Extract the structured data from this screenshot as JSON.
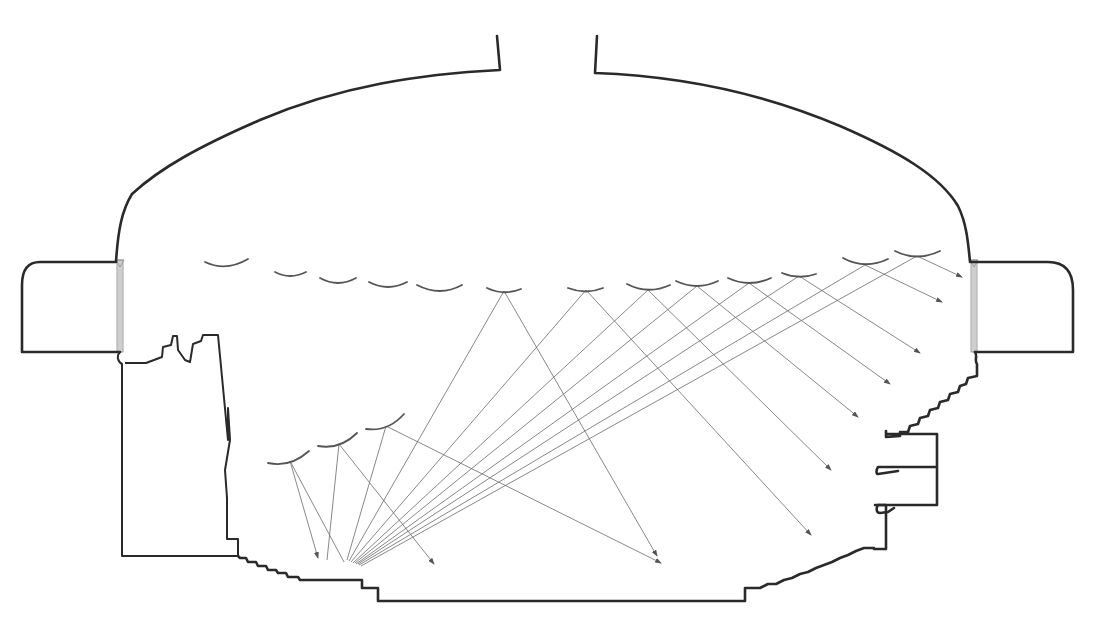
{
  "diagram": {
    "type": "architectural-acoustic-section",
    "canvas": {
      "width": 1093,
      "height": 621,
      "background": "#ffffff"
    },
    "colors": {
      "wall": "#2a2a2a",
      "reflector": "#555555",
      "ray": "#6a6a6a",
      "louver": "#e4e4e4"
    },
    "shell": {
      "roof_path": "M 497 36 L 500 70 C 420 74 340 86 260 120 C 200 146 160 168 132 194 C 122 210 118 230 116 262 L 40 262 Q 22 262 22 285 L 22 352 L 120 352",
      "roof_path_right": "M 597 36 L 595 73 C 680 76 760 92 840 126 C 900 152 940 176 958 206 C 966 222 968 240 970 262 L 1048 262 Q 1073 262 1073 290 L 1073 352 L 975 352"
    },
    "left_tower": {
      "path": "M 120 352 C 116 356 118 362 122 364 L 122 556 L 238 556 L 238 539 L 227 539 L 227 498 L 225 470 L 230 440 L 228 408 L 228 440 L 218 335 L 203 335 L 201 341 L 193 344 L 190 362 L 185 360 L 178 350 L 177 336 L 173 336 L 171 345 L 163 347 L 162 357 L 154 360 L 146 363 L 125 363"
    },
    "floor": {
      "path": "M 238 556 L 240 558 L 246 558 L 248 562 L 256 562 L 258 566 L 266 566 L 268 570 L 276 570 L 278 573 L 286 573 L 288 577 L 298 577 L 300 580 L 362 580 L 362 588 L 378 588 L 378 601 L 745 601 L 745 588 L 760 588 L 768 584 L 776 584 L 784 580 L 792 578 L 800 574 L 808 572 L 816 568 L 824 565 L 832 562 L 840 558 L 848 555 L 856 551 L 864 548 L 874 548 L 874 549 L 886 549 L 886 505 L 875 505"
    },
    "right_balconies": {
      "path": "M 975 352 C 978 356 974 360 977 364 L 977 376 L 968 378 L 966 384 L 960 386 L 958 392 L 950 394 L 948 400 L 940 402 L 938 408 L 930 410 L 928 416 L 920 418 L 918 424 L 910 426 L 908 432 L 900 432 L 900 436 L 886 437 L 886 431 L 886 434 L 937 434 L 937 467 L 878 467 C 876 470 876 474 878 474 L 898 471 M 937 467 L 937 505 L 878 505 C 876 508 876 513 880 513 L 888 512 L 894 508"
    },
    "windows": [
      {
        "name": "left-window",
        "x": 117,
        "y": 260,
        "width": 6,
        "height": 92
      },
      {
        "name": "right-window",
        "x": 971,
        "y": 260,
        "width": 6,
        "height": 92
      }
    ],
    "ceiling_reflectors": [
      {
        "x1": 205,
        "y1": 262,
        "x2": 248,
        "y2": 259,
        "cx": 226,
        "cy": 272
      },
      {
        "x1": 275,
        "y1": 272,
        "x2": 306,
        "y2": 272,
        "cx": 290,
        "cy": 280
      },
      {
        "x1": 320,
        "y1": 278,
        "x2": 356,
        "y2": 278,
        "cx": 338,
        "cy": 288
      },
      {
        "x1": 369,
        "y1": 282,
        "x2": 407,
        "y2": 282,
        "cx": 388,
        "cy": 292
      },
      {
        "x1": 417,
        "y1": 285,
        "x2": 462,
        "y2": 285,
        "cx": 440,
        "cy": 297
      },
      {
        "x1": 487,
        "y1": 288,
        "x2": 521,
        "y2": 289,
        "cx": 504,
        "cy": 296
      },
      {
        "x1": 568,
        "y1": 288,
        "x2": 603,
        "y2": 288,
        "cx": 586,
        "cy": 295
      },
      {
        "x1": 627,
        "y1": 284,
        "x2": 670,
        "y2": 285,
        "cx": 648,
        "cy": 295
      },
      {
        "x1": 676,
        "y1": 281,
        "x2": 718,
        "y2": 281,
        "cx": 697,
        "cy": 291
      },
      {
        "x1": 728,
        "y1": 278,
        "x2": 771,
        "y2": 278,
        "cx": 749,
        "cy": 288
      },
      {
        "x1": 782,
        "y1": 273,
        "x2": 816,
        "y2": 274,
        "cx": 799,
        "cy": 280
      },
      {
        "x1": 843,
        "y1": 258,
        "x2": 888,
        "y2": 259,
        "cx": 865,
        "cy": 270
      },
      {
        "x1": 895,
        "y1": 251,
        "x2": 940,
        "y2": 251,
        "cx": 917,
        "cy": 262
      }
    ],
    "lower_reflectors": [
      {
        "x1": 268,
        "y1": 463,
        "x2": 309,
        "y2": 451,
        "cx": 290,
        "cy": 468
      },
      {
        "x1": 318,
        "y1": 446,
        "x2": 357,
        "y2": 433,
        "cx": 340,
        "cy": 450
      },
      {
        "x1": 366,
        "y1": 429,
        "x2": 404,
        "y2": 414,
        "cx": 388,
        "cy": 432
      }
    ],
    "source": {
      "x": 345,
      "y": 564
    },
    "rays": [
      {
        "from": [
          290,
          461
        ],
        "to": [
          318,
          558
        ],
        "arrow": true
      },
      {
        "from": [
          290,
          461
        ],
        "to": [
          344,
          562
        ],
        "arrow": false
      },
      {
        "from": [
          339,
          444
        ],
        "to": [
          327,
          560
        ],
        "arrow": false
      },
      {
        "from": [
          339,
          444
        ],
        "to": [
          434,
          564
        ],
        "arrow": true
      },
      {
        "from": [
          386,
          426
        ],
        "to": [
          347,
          560
        ],
        "arrow": false
      },
      {
        "from": [
          386,
          426
        ],
        "to": [
          661,
          563
        ],
        "arrow": true
      },
      {
        "from": [
          504,
          291
        ],
        "to": [
          349,
          561
        ],
        "arrow": false
      },
      {
        "from": [
          504,
          291
        ],
        "to": [
          657,
          556
        ],
        "arrow": true
      },
      {
        "from": [
          586,
          290
        ],
        "to": [
          351,
          562
        ],
        "arrow": false
      },
      {
        "from": [
          586,
          290
        ],
        "to": [
          811,
          535
        ],
        "arrow": true
      },
      {
        "from": [
          648,
          290
        ],
        "to": [
          353,
          563
        ],
        "arrow": false
      },
      {
        "from": [
          648,
          290
        ],
        "to": [
          831,
          470
        ],
        "arrow": true
      },
      {
        "from": [
          697,
          286
        ],
        "to": [
          355,
          563
        ],
        "arrow": false
      },
      {
        "from": [
          697,
          286
        ],
        "to": [
          858,
          417
        ],
        "arrow": true
      },
      {
        "from": [
          749,
          283
        ],
        "to": [
          356,
          564
        ],
        "arrow": false
      },
      {
        "from": [
          749,
          283
        ],
        "to": [
          890,
          384
        ],
        "arrow": true
      },
      {
        "from": [
          799,
          276
        ],
        "to": [
          358,
          564
        ],
        "arrow": false
      },
      {
        "from": [
          799,
          276
        ],
        "to": [
          920,
          353
        ],
        "arrow": true
      },
      {
        "from": [
          865,
          265
        ],
        "to": [
          359,
          565
        ],
        "arrow": false
      },
      {
        "from": [
          865,
          265
        ],
        "to": [
          942,
          302
        ],
        "arrow": true
      },
      {
        "from": [
          917,
          256
        ],
        "to": [
          361,
          566
        ],
        "arrow": false
      },
      {
        "from": [
          917,
          256
        ],
        "to": [
          962,
          277
        ],
        "arrow": true
      }
    ]
  }
}
